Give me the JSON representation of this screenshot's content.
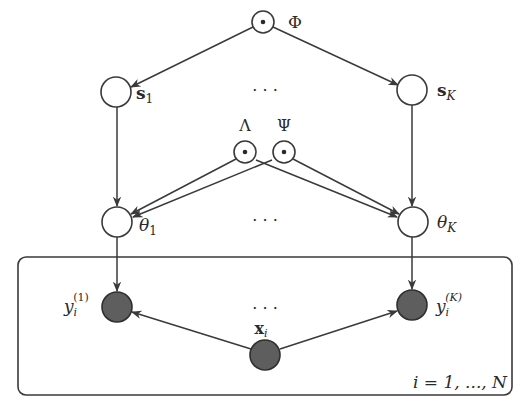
{
  "diagram": {
    "type": "probabilistic-graphical-model",
    "nodes": {
      "phi": {
        "label": "Φ",
        "kind": "hyperparameter"
      },
      "s1": {
        "label": "s",
        "sub": "1",
        "kind": "latent"
      },
      "sK": {
        "label": "s",
        "sub": "K",
        "kind": "latent"
      },
      "lambda": {
        "label": "Λ",
        "kind": "hyperparameter"
      },
      "psi": {
        "label": "Ψ",
        "kind": "hyperparameter"
      },
      "theta1": {
        "label": "θ",
        "sub": "1",
        "kind": "latent"
      },
      "thetaK": {
        "label": "θ",
        "sub": "K",
        "kind": "latent"
      },
      "y1": {
        "label": "y",
        "sub": "i",
        "sup": "(1)",
        "kind": "observed"
      },
      "yK": {
        "label": "y",
        "sub": "i",
        "sup": "(K)",
        "kind": "observed"
      },
      "xi": {
        "label": "x",
        "sub": "i",
        "kind": "observed"
      }
    },
    "ellipsis": "· · ·",
    "plate": {
      "label": "i = 1, ..., N"
    },
    "edges": [
      [
        "phi",
        "s1"
      ],
      [
        "phi",
        "sK"
      ],
      [
        "s1",
        "theta1"
      ],
      [
        "sK",
        "thetaK"
      ],
      [
        "lambda",
        "theta1"
      ],
      [
        "lambda",
        "thetaK"
      ],
      [
        "psi",
        "theta1"
      ],
      [
        "psi",
        "thetaK"
      ],
      [
        "theta1",
        "y1"
      ],
      [
        "thetaK",
        "yK"
      ],
      [
        "xi",
        "y1"
      ],
      [
        "xi",
        "yK"
      ]
    ]
  }
}
